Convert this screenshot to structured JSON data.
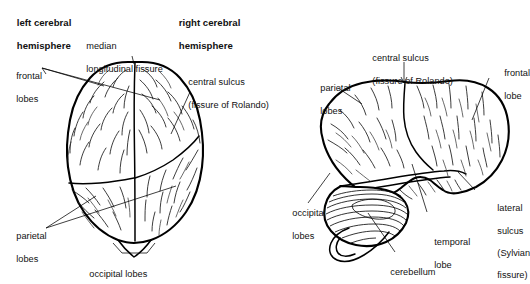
{
  "figure": {
    "background_color": "#ffffff",
    "ink_color": "#000000",
    "views": [
      {
        "name": "superior-view",
        "description": "Top (superior) view of the brain showing both cerebral hemispheres separated by the median longitudinal fissure"
      },
      {
        "name": "lateral-view",
        "description": "Side (lateral) view of the left cerebral hemisphere showing frontal, parietal, temporal and occipital lobes plus cerebellum"
      }
    ]
  },
  "labels": {
    "left_cerebral_hemisphere": {
      "line1": "left cerebral",
      "line2": "hemisphere",
      "bold": true
    },
    "right_cerebral_hemisphere": {
      "line1": "right cerebral",
      "line2": "hemisphere",
      "bold": true
    },
    "median_longitudinal_fissure": {
      "line1": "median",
      "line2": "longitudinal fissure"
    },
    "frontal_lobes": {
      "line1": "frontal",
      "line2": "lobes"
    },
    "central_sulcus_superior": {
      "line1": "central sulcus",
      "line2": "(fissure of Rolando)"
    },
    "parietal_lobes_superior": {
      "line1": "parietal",
      "line2": "lobes"
    },
    "occipital_lobes_superior": {
      "line1": "occipital lobes"
    },
    "central_sulcus_lateral": {
      "line1": "central sulcus",
      "line2": "(fissure of Rolando)"
    },
    "parietal_lobes_lateral": {
      "line1": "parietal",
      "line2": "lobes"
    },
    "frontal_lobe_lateral": {
      "line1": "frontal",
      "line2": "lobe"
    },
    "occipital_lobes_lateral": {
      "line1": "occipital",
      "line2": "lobes"
    },
    "temporal_lobe_lateral": {
      "line1": "temporal",
      "line2": "lobe"
    },
    "lateral_sulcus_lateral": {
      "line1": "lateral",
      "line2": "sulcus",
      "line3": "(Sylvian",
      "line4": "fissure)"
    },
    "cerebellum": {
      "line1": "cerebellum"
    }
  }
}
